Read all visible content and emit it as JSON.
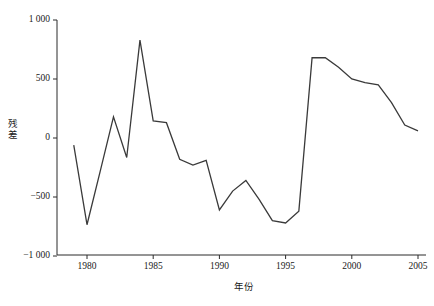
{
  "chart_data": {
    "type": "line",
    "title": "",
    "xlabel": "年份",
    "ylabel": "残差",
    "xlim": [
      1978.0,
      2005.6
    ],
    "ylim": [
      -1000,
      1000
    ],
    "grid": false,
    "legend": null,
    "x_ticks": [
      "1980",
      "1985",
      "1990",
      "1995",
      "2000",
      "2005"
    ],
    "x_tick_values": [
      1980,
      1985,
      1990,
      1995,
      2000,
      2005
    ],
    "y_ticks": [
      "1 000",
      "500",
      "0",
      "−500",
      "−1 000"
    ],
    "y_tick_values": [
      1000,
      500,
      0,
      -500,
      -1000
    ],
    "x": [
      1979,
      1980,
      1981,
      1982,
      1983,
      1984,
      1985,
      1986,
      1987,
      1988,
      1989,
      1990,
      1991,
      1992,
      1993,
      1994,
      1995,
      1996,
      1997,
      1998,
      1999,
      2000,
      2001,
      2002,
      2003,
      2004,
      2005
    ],
    "series": [
      {
        "name": "残差",
        "color": "#3a3a3a",
        "values": [
          -60,
          -735,
          -280,
          180,
          -165,
          830,
          145,
          130,
          -180,
          -230,
          -190,
          -610,
          -450,
          -360,
          -520,
          -700,
          -720,
          -620,
          680,
          680,
          600,
          500,
          470,
          450,
          300,
          110,
          60
        ]
      }
    ]
  }
}
